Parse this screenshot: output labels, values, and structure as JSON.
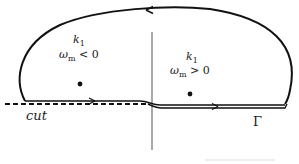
{
  "diagram": {
    "title": "",
    "regions": [
      {
        "id": "left",
        "k_label": "k",
        "k_sub": "1",
        "omega_label": "ω",
        "omega_sub": "m",
        "condition": "< 0"
      },
      {
        "id": "right",
        "k_label": "k",
        "k_sub": "1",
        "omega_label": "ω",
        "omega_sub": "m",
        "condition": "> 0"
      }
    ],
    "cut_label": "cut",
    "contour_label": "Γ",
    "points": [
      {
        "id": "pole-left",
        "x": 80,
        "y": 84
      },
      {
        "id": "pole-right",
        "x": 190,
        "y": 94
      }
    ],
    "colors": {
      "stroke": "#111111",
      "axis": "#555555",
      "text": "#222222"
    }
  }
}
